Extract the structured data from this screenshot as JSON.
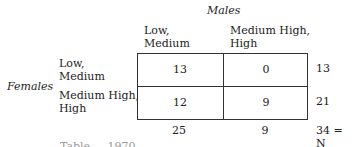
{
  "table": {
    "column_variable": "Males",
    "row_variable": "Females",
    "column_headers": [
      [
        "Low,",
        "Medium"
      ],
      [
        "Medium High,",
        "High"
      ]
    ],
    "row_headers": [
      [
        "Low,",
        "Medium"
      ],
      [
        "Medium High,",
        "High"
      ]
    ],
    "cells": [
      [
        "13",
        "0"
      ],
      [
        "12",
        "9"
      ]
    ],
    "row_totals": [
      "13",
      "21"
    ],
    "column_totals": [
      "25",
      "9"
    ],
    "grand_total": "34 = N"
  },
  "caption_partial": "Table ... 1970"
}
